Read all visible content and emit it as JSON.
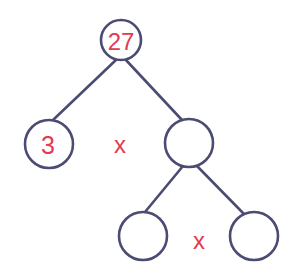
{
  "diagram": {
    "type": "factor-tree",
    "colors": {
      "stroke": "#4b4b73",
      "label": "#e23a50",
      "background": "#ffffff"
    },
    "nodes": [
      {
        "id": "root",
        "label": "27",
        "cx": 121,
        "cy": 40,
        "r": 20
      },
      {
        "id": "left",
        "label": "3",
        "cx": 49,
        "cy": 144,
        "r": 24
      },
      {
        "id": "right",
        "label": "",
        "cx": 189,
        "cy": 143,
        "r": 24
      },
      {
        "id": "right-left",
        "label": "",
        "cx": 143,
        "cy": 236,
        "r": 24
      },
      {
        "id": "right-right",
        "label": "",
        "cx": 254,
        "cy": 236,
        "r": 24
      }
    ],
    "operators": [
      {
        "id": "op-top",
        "symbol": "x",
        "x": 120,
        "y": 145
      },
      {
        "id": "op-bottom",
        "symbol": "x",
        "x": 199,
        "y": 241
      }
    ],
    "edges": [
      {
        "from": "root",
        "to": "left"
      },
      {
        "from": "root",
        "to": "right"
      },
      {
        "from": "right",
        "to": "right-left"
      },
      {
        "from": "right",
        "to": "right-right"
      }
    ]
  }
}
